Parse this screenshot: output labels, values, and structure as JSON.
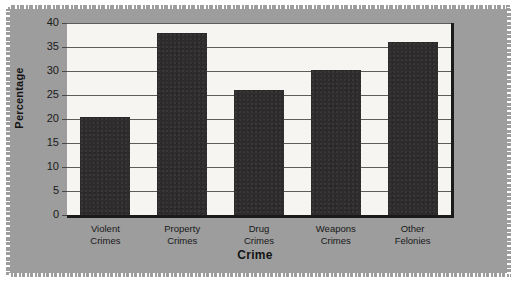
{
  "figure": {
    "background_color": "#9d9d9d",
    "plot_background_color": "#f6f5f1",
    "bar_color": "#2e2c2c",
    "gridline_color": "#5e5c59",
    "axis_color": "#1b1b1b"
  },
  "chart_data": {
    "type": "bar",
    "title": "",
    "xlabel": "Crime",
    "ylabel": "Percentage",
    "categories": [
      "Violent Crimes",
      "Property Crimes",
      "Drug Crimes",
      "Weapons Crimes",
      "Other Felonies"
    ],
    "category_lines": [
      [
        "Violent",
        "Crimes"
      ],
      [
        "Property",
        "Crimes"
      ],
      [
        "Drug",
        "Crimes"
      ],
      [
        "Weapons",
        "Crimes"
      ],
      [
        "Other",
        "Felonies"
      ]
    ],
    "values": [
      20.5,
      38.0,
      26.0,
      30.3,
      36.0
    ],
    "ylim": [
      0,
      40
    ],
    "ytick_values": [
      0,
      5,
      10,
      15,
      20,
      25,
      30,
      35,
      40
    ],
    "ytick_labels": [
      "0",
      "5",
      "10",
      "15",
      "20",
      "25",
      "30",
      "35",
      "40"
    ],
    "grid": true,
    "grid_axis": "y",
    "legend": false,
    "legend_position": "none"
  }
}
